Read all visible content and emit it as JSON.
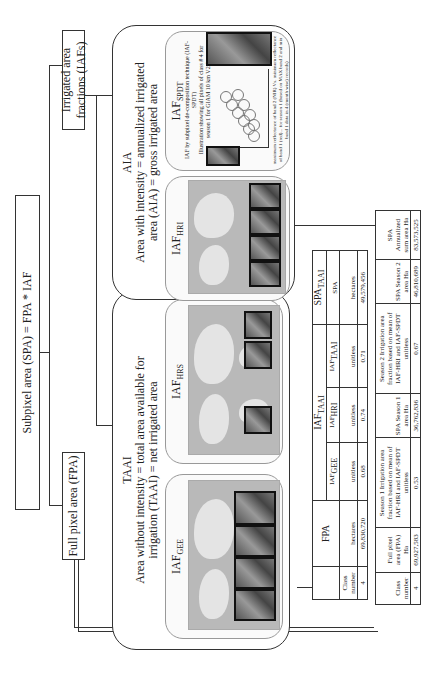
{
  "top": {
    "spa_formula": "Subpixel area (SPA) = FPA * IAF",
    "fpa_box": "Full pixel area (FPA)",
    "iaf_box": "Irrigated area fractions (IAFs)"
  },
  "taai": {
    "title": "TAAI",
    "line1": "Area without intensity = total  area available for",
    "line2": "irrigation (TAAI) = net irrigated area",
    "panels": [
      {
        "label": "IAF",
        "sub": "GEE"
      },
      {
        "label": "IAF",
        "sub": "HRS"
      }
    ]
  },
  "aia": {
    "title": "AIA",
    "line1": "Area with intensity = annualized irrigated",
    "line2": "area (AIA) = gross irrigated area",
    "panels": [
      {
        "label": "IAF",
        "sub": "HRI"
      },
      {
        "label": "IAF",
        "sub": "SPDT",
        "caption1": "IAF by subpixel de-composition technique (IAF-SPDT)",
        "caption2": "Illustration showing all pixels of class # 4 for",
        "caption3": "season 1 for GIAM 10 km V2.0",
        "xaxis_caption": "maximum reflectance of band 2 (NIR) Vs. minimum reflectance of band 1 (red)... for season 1 (based on MAX band 2 and min band 1 data in 4 (month wise) records)",
        "yaxis_caption": "average (reflectance band 1 red)"
      }
    ]
  },
  "table1": {
    "header_fpa": "FPA",
    "header_iaf": "IAF",
    "header_iaf_sub": "TAAI",
    "header_spa": "SPA",
    "header_spa_sub": "TAAI",
    "cols": [
      {
        "label": "Class number",
        "sub": "",
        "unit": "",
        "value": "4"
      },
      {
        "label": "",
        "sub": "",
        "unit": "hectares",
        "value": "69,830,720"
      },
      {
        "label": "IAF",
        "sub": "GEE",
        "unit": "unitless",
        "value": "0.68"
      },
      {
        "label": "IAF",
        "sub": "HRI",
        "unit": "unitless",
        "value": "0.74"
      },
      {
        "label": "IAF",
        "sub": "TAAI",
        "unit": "unitless",
        "value": "0.71"
      },
      {
        "label": "SPA",
        "sub": "",
        "unit": "hectares",
        "value": "49,579,456"
      }
    ]
  },
  "table2": {
    "cols": [
      {
        "label": "Class number",
        "value": "4"
      },
      {
        "label": "Full pixel area (FPA) Ha",
        "value": "69,927,583"
      },
      {
        "label": "Season 1 Irrigation area fraction based on mean of IAF-HRI and IAF-SPDT unitless",
        "value": "0.53"
      },
      {
        "label": "SPA Season 1 area Ha",
        "value": "36,762,836"
      },
      {
        "label": "Season 2 Irrigation area fraction based on mean of IAF-HRI and IAF-SPDT unitless",
        "value": "0.67"
      },
      {
        "label": "SPA Season 2 area Ha",
        "value": "46,810,689"
      },
      {
        "label": "SPA Annualized sum area Ha",
        "value": "83,573,525"
      }
    ]
  }
}
